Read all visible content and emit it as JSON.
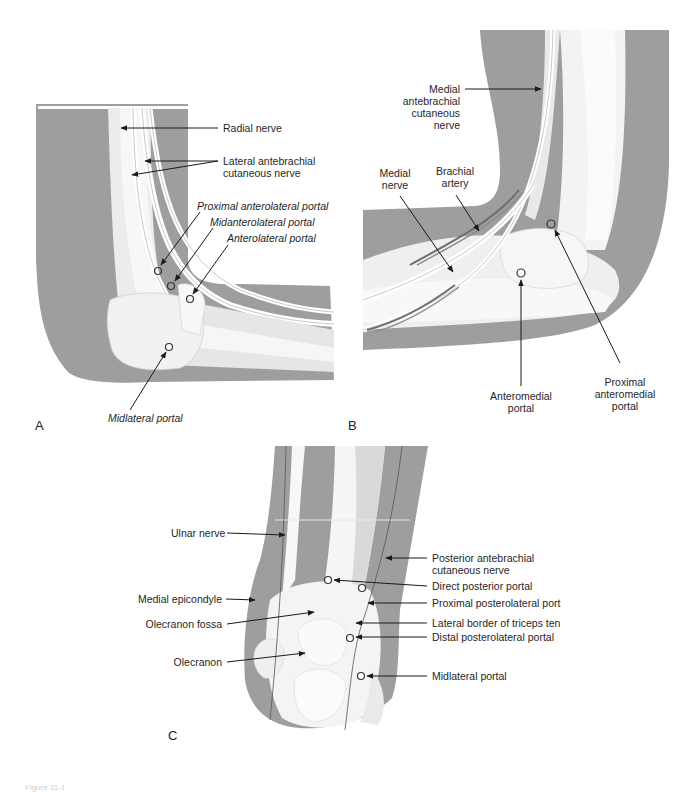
{
  "figure": {
    "colors": {
      "skin_silhouette": "#9e9e9e",
      "bone": "#f4f4f4",
      "soft_tissue": "#dcdcdc",
      "nerve_line": "#555555",
      "artery": "#7a7a7a",
      "leader_line": "#1a1a1a",
      "background": "#ffffff"
    },
    "caption_fragment": "Figure 11-1",
    "panels": [
      {
        "id": "A",
        "letter": "A",
        "view": "lateral elbow",
        "labels": {
          "radial_nerve": "Radial nerve",
          "lateral_antebrachial_1": "Lateral antebrachial",
          "lateral_antebrachial_2": "cutaneous nerve",
          "proximal_anterolateral_portal": "Proximal anterolateral portal",
          "midanterolateral_portal": "Midanterolateral portal",
          "anterolateral_portal": "Anterolateral portal",
          "midlateral_portal": "Midlateral portal"
        }
      },
      {
        "id": "B",
        "letter": "B",
        "view": "medial elbow",
        "labels": {
          "medial_antebrachial_1": "Medial",
          "medial_antebrachial_2": "antebrachial",
          "medial_antebrachial_3": "cutaneous",
          "medial_antebrachial_4": "nerve",
          "medial_nerve_1": "Medial",
          "medial_nerve_2": "nerve",
          "brachial_artery_1": "Brachial",
          "brachial_artery_2": "artery",
          "anteromedial_portal_1": "Anteromedial",
          "anteromedial_portal_2": "portal",
          "proximal_anteromedial_1": "Proximal",
          "proximal_anteromedial_2": "anteromedial",
          "proximal_anteromedial_3": "portal"
        }
      },
      {
        "id": "C",
        "letter": "C",
        "view": "posterior elbow",
        "labels": {
          "ulnar_nerve": "Ulnar nerve",
          "posterior_antebrachial_1": "Posterior antebrachial",
          "posterior_antebrachial_2": "cutaneous nerve",
          "direct_posterior_portal": "Direct posterior portal",
          "proximal_posterolateral_portal": "Proximal posterolateral port",
          "lateral_border_triceps": "Lateral border of triceps ten",
          "medial_epicondyle": "Medial epicondyle",
          "olecranon_fossa": "Olecranon fossa",
          "distal_posterolateral_portal": "Distal posterolateral portal",
          "olecranon": "Olecranon",
          "midlateral_portal": "Midlateral portal"
        }
      }
    ]
  }
}
